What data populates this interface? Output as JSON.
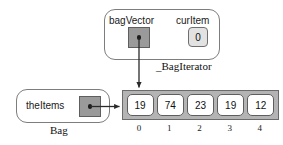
{
  "diagram": {
    "objects": {
      "iterator": {
        "class_caption": "_BagIterator",
        "fields": [
          {
            "name": "bagVector",
            "kind": "pointer",
            "value": ""
          },
          {
            "name": "curItem",
            "kind": "value",
            "value": "0"
          }
        ]
      },
      "bag": {
        "class_caption": "Bag",
        "fields": [
          {
            "name": "theItems",
            "kind": "pointer",
            "value": ""
          }
        ]
      }
    },
    "array": {
      "cells": [
        "19",
        "74",
        "23",
        "19",
        "12"
      ],
      "indices": [
        "0",
        "1",
        "2",
        "3",
        "4"
      ]
    },
    "arrows": [
      {
        "from": "bagVector-slot",
        "to": "array-cell-0-top",
        "style": "solid-arrow"
      },
      {
        "from": "theItems-slot",
        "to": "array-left-edge",
        "style": "solid-arrow"
      }
    ],
    "colors": {
      "pointer_slot_fill": "#9a9a9a",
      "value_slot_fill": "#e2e2e2",
      "array_frame_fill": "#b4b4b4",
      "cell_fill": "#ffffff",
      "border": "#6b6b6b",
      "arrow": "#2a2a2a",
      "background": "#ffffff"
    }
  }
}
